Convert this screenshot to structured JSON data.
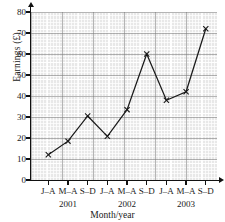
{
  "chart_data": {
    "type": "line",
    "title": "",
    "xlabel": "Month/year",
    "ylabel": "Earnings (£)",
    "ylim": [
      0,
      80
    ],
    "ytick_values": [
      0,
      10,
      20,
      30,
      40,
      50,
      60,
      70,
      80
    ],
    "ytick_labels": [
      "0",
      "10",
      "20",
      "30",
      "40",
      "50",
      "60",
      "70",
      "80"
    ],
    "categories": [
      "J–A",
      "M–A",
      "S–D",
      "J–A",
      "M–A",
      "S–D",
      "J–A",
      "M–A",
      "S–D"
    ],
    "years": [
      "2001",
      "2002",
      "2003"
    ],
    "year_spans": [
      {
        "label": "2001",
        "start_index": 0,
        "end_index": 2
      },
      {
        "label": "2002",
        "start_index": 3,
        "end_index": 5
      },
      {
        "label": "2003",
        "start_index": 6,
        "end_index": 8
      }
    ],
    "values": [
      12,
      18.5,
      30.5,
      20.8,
      33.5,
      60,
      38,
      42,
      72
    ],
    "marker": "x",
    "grid": true,
    "grid_style": "graph-paper",
    "legend": "none",
    "line_color": "#1a1a1a",
    "plot_background": "#e8e8e8"
  }
}
